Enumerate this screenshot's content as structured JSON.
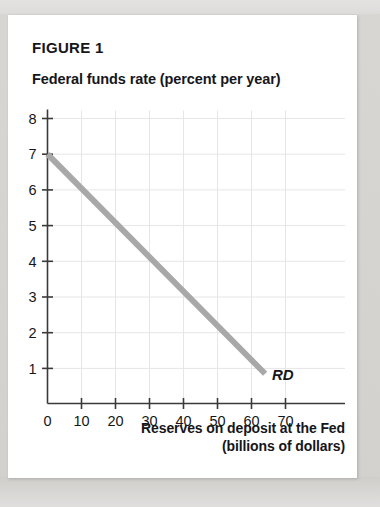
{
  "page": {
    "figure_title": "FIGURE 1",
    "background_color": "#ffffff",
    "scan_margin_color": "#d8d8d6"
  },
  "chart_data": {
    "type": "line",
    "title": "FIGURE 1",
    "ylabel": "Federal funds rate (percent per year)",
    "xlabel": "Reserves on deposit at the Fed",
    "xlabel_line2": "(billions of dollars)",
    "xlim": [
      0,
      75
    ],
    "ylim": [
      0,
      8.5
    ],
    "xticks": [
      0,
      10,
      20,
      30,
      40,
      50,
      60,
      70
    ],
    "xtick_labels": [
      "0",
      "10",
      "20",
      "30",
      "40",
      "50",
      "60",
      "70"
    ],
    "yticks": [
      1,
      2,
      3,
      4,
      5,
      6,
      7,
      8
    ],
    "ytick_labels": [
      "1",
      "2",
      "3",
      "4",
      "5",
      "6",
      "7",
      "8"
    ],
    "grid": true,
    "grid_color": "#e6e6e6",
    "legend": "none",
    "series": [
      {
        "name": "RD",
        "label": "RD",
        "description": "Demand for reserves curve",
        "color": "#a8a8a8",
        "linewidth": 6,
        "x": [
          0,
          64
        ],
        "y": [
          7.0,
          0.85
        ],
        "annotation": "RD",
        "annotation_x": 66,
        "annotation_y": 0.85
      }
    ],
    "annotations": [
      {
        "text": "RD",
        "x": 66,
        "y": 0.85,
        "style": "bold-italic"
      }
    ]
  }
}
